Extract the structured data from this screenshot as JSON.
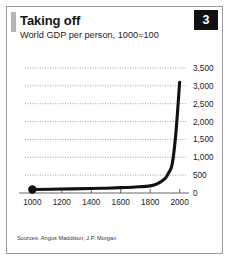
{
  "card": {
    "title": "Taking off",
    "subtitle": "World GDP per person, 1000=100",
    "badge": "3",
    "source": "Sources: Angus Maddison; J.P. Morgan",
    "accent_color": "#b4b4b4",
    "badge_bg": "#111111",
    "badge_fg": "#ffffff",
    "line_color": "#111111",
    "grid_color": "#8e8e8e",
    "border_color": "#9b9b9b"
  },
  "chart_data": {
    "type": "line",
    "title": "Taking off",
    "subtitle": "World GDP per person, 1000=100",
    "xlabel": "",
    "ylabel": "",
    "xlim": [
      950,
      2050
    ],
    "ylim": [
      0,
      3750
    ],
    "grid": true,
    "grid_axis": "y",
    "legend": false,
    "marker_at_start": true,
    "yticks": [
      0,
      500,
      1000,
      1500,
      2000,
      2500,
      3000,
      3500
    ],
    "ytick_labels": [
      "0",
      "500",
      "1,000",
      "1,500",
      "2,000",
      "2,500",
      "3,000",
      "3,500"
    ],
    "xticks": [
      1000,
      1200,
      1400,
      1600,
      1800,
      2000
    ],
    "xtick_labels": [
      "1000",
      "1200",
      "1400",
      "1600",
      "1800",
      "2000"
    ],
    "series": [
      {
        "name": "World GDP per person (1000=100)",
        "x": [
          1000,
          1200,
          1400,
          1500,
          1600,
          1700,
          1800,
          1850,
          1900,
          1925,
          1950,
          1975,
          2000
        ],
        "values": [
          100,
          110,
          125,
          135,
          150,
          170,
          200,
          260,
          400,
          560,
          820,
          1700,
          3100
        ]
      }
    ]
  }
}
